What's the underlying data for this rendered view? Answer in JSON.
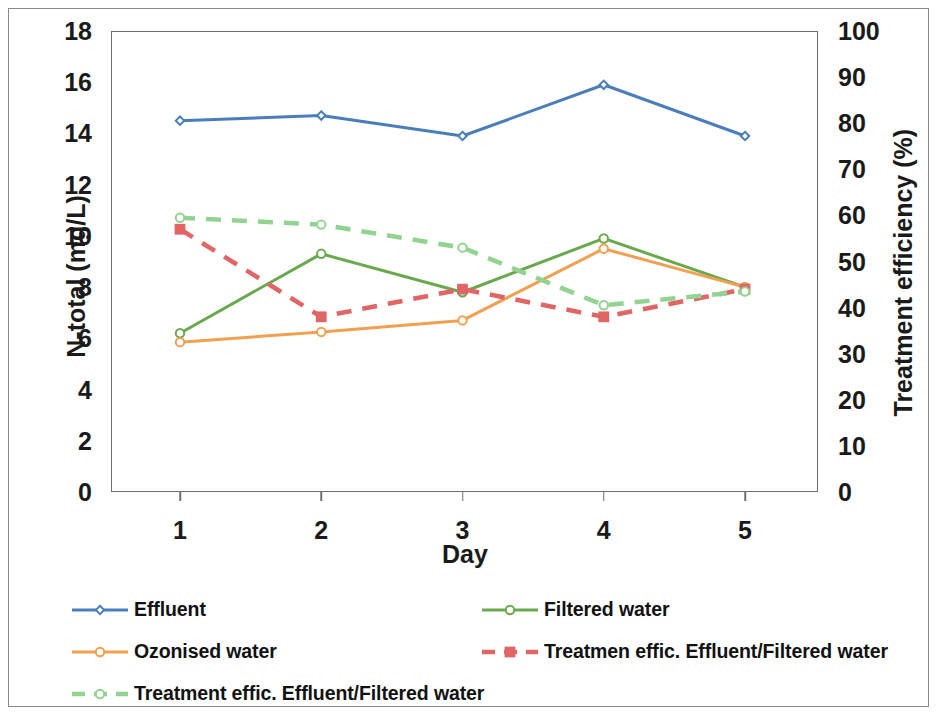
{
  "chart_data": {
    "type": "line",
    "title": "",
    "xlabel": "Day",
    "ylabel": "N-total (mg/L)",
    "ylabel_secondary": "Treatment efficiency (%)",
    "categories": [
      "1",
      "2",
      "3",
      "4",
      "5"
    ],
    "x": [
      1,
      2,
      3,
      4,
      5
    ],
    "ylim": [
      0,
      18
    ],
    "ylim_secondary": [
      0,
      100
    ],
    "yticks": [
      "0",
      "2",
      "4",
      "6",
      "8",
      "10",
      "12",
      "14",
      "16",
      "18"
    ],
    "yticks_secondary": [
      "0",
      "10",
      "20",
      "30",
      "40",
      "50",
      "60",
      "70",
      "80",
      "90",
      "100"
    ],
    "xticks": [
      "1",
      "2",
      "3",
      "4",
      "5"
    ],
    "grid": false,
    "legend_position": "bottom",
    "series": [
      {
        "name": "Effluent",
        "axis": "left",
        "unit": "mg/L",
        "color": "#4a7ebb",
        "style": "solid",
        "marker": "diamond",
        "values": [
          14.5,
          14.7,
          13.9,
          15.9,
          13.9
        ]
      },
      {
        "name": "Filtered water",
        "axis": "left",
        "unit": "mg/L",
        "color": "#6aa84f",
        "style": "solid",
        "marker": "circle",
        "values": [
          6.2,
          9.3,
          7.8,
          9.9,
          8.0
        ]
      },
      {
        "name": "Ozonised water",
        "axis": "left",
        "unit": "mg/L",
        "color": "#f0a050",
        "style": "solid",
        "marker": "circle",
        "values": [
          5.85,
          6.25,
          6.7,
          9.5,
          8.0
        ]
      },
      {
        "name": "Treatmen effic. Effluent/Filtered water",
        "axis": "right",
        "unit": "%",
        "color": "#e06666",
        "style": "dashed",
        "marker": "square",
        "values": [
          57,
          38,
          44,
          38,
          44
        ]
      },
      {
        "name": "Treatment effic. Effluent/Filtered water",
        "axis": "right",
        "unit": "%",
        "color": "#93d391",
        "style": "dashed",
        "marker": "circle",
        "values": [
          59.5,
          58,
          53,
          40.5,
          43.5
        ]
      }
    ]
  },
  "legend": {
    "items": [
      {
        "label": "Effluent",
        "color": "#4a7ebb",
        "style": "solid",
        "marker": "diamond",
        "col": 0,
        "row": 0
      },
      {
        "label": "Filtered water",
        "color": "#6aa84f",
        "style": "solid",
        "marker": "circle",
        "col": 1,
        "row": 0
      },
      {
        "label": "Ozonised water",
        "color": "#f0a050",
        "style": "solid",
        "marker": "circle",
        "col": 0,
        "row": 1
      },
      {
        "label": "Treatmen effic. Effluent/Filtered water",
        "color": "#e06666",
        "style": "dashed",
        "marker": "square",
        "col": 1,
        "row": 1
      },
      {
        "label": "Treatment effic. Effluent/Filtered water",
        "color": "#93d391",
        "style": "dashed",
        "marker": "circle",
        "col": 0,
        "row": 2
      }
    ]
  }
}
